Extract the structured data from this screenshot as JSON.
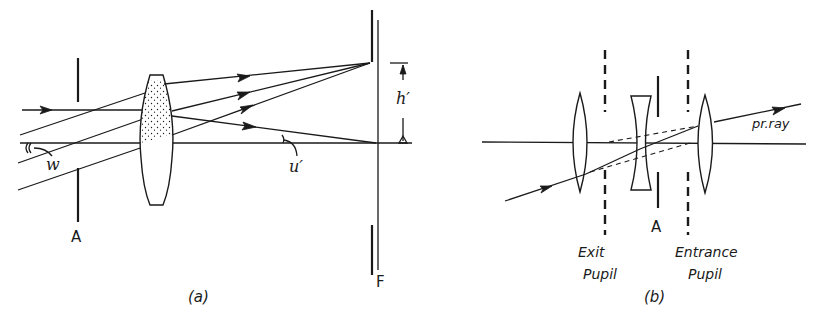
{
  "figure": {
    "panel_a": {
      "caption": "(a)",
      "labels": {
        "aperture_stop": "A",
        "focal_plane": "F",
        "field_angle": "w",
        "image_angle": "u′",
        "image_height": "h′"
      }
    },
    "panel_b": {
      "caption": "(b)",
      "labels": {
        "aperture_stop": "A",
        "principal_ray": "pr.ray",
        "exit_pupil_line1": "Exit",
        "exit_pupil_line2": "Pupil",
        "entrance_pupil_line1": "Entrance",
        "entrance_pupil_line2": "Pupil"
      }
    }
  }
}
